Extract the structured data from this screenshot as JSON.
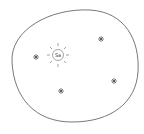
{
  "diagram": {
    "boundary": {
      "shape": "blob",
      "stroke": "#555555"
    },
    "center": {
      "label": "Sa",
      "type": "sun"
    },
    "stars": [
      {
        "id": "star-left",
        "x": 36,
        "y": 57
      },
      {
        "id": "star-top-right",
        "x": 101,
        "y": 39
      },
      {
        "id": "star-right",
        "x": 114,
        "y": 81
      },
      {
        "id": "star-bottom",
        "x": 61,
        "y": 91
      }
    ],
    "colors": {
      "stroke": "#555555",
      "background": "#ffffff"
    }
  }
}
